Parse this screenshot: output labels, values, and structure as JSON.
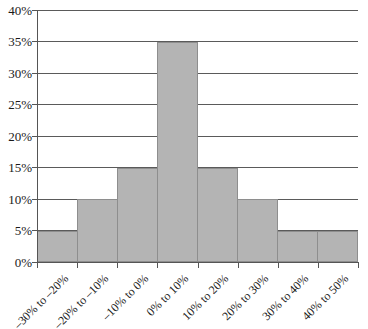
{
  "chart_data": {
    "type": "bar",
    "title": "",
    "subtitle": "",
    "xlabel": "",
    "ylabel": "",
    "categories": [
      "–30% to –20%",
      "–20% to –10%",
      "–10% to 0%",
      "0% to 10%",
      "10% to 20%",
      "20% to 30%",
      "30% to 40%",
      "40% to 50%"
    ],
    "values": [
      5,
      10,
      15,
      35,
      15,
      10,
      5,
      5
    ],
    "value_labels": [
      "5%",
      "10%",
      "15%",
      "35%",
      "15%",
      "10%",
      "5%",
      "5%"
    ],
    "ylim": [
      0,
      40
    ],
    "ytick_values": [
      0,
      5,
      10,
      15,
      20,
      25,
      30,
      35,
      40
    ],
    "ytick_labels": [
      "0%",
      "5%",
      "10%",
      "15%",
      "20%",
      "25%",
      "30%",
      "35%",
      "40%"
    ],
    "grid": true,
    "grid_axis": "y",
    "legend": "none",
    "bar_gap": "none",
    "series": [
      {
        "name": "Frequency",
        "values": [
          5,
          10,
          15,
          35,
          15,
          10,
          5,
          5
        ]
      }
    ],
    "colors": {
      "bar_fill": "#b4b4b4",
      "bar_stroke": "#8e8e8e",
      "gridline": "#5a5a5a",
      "axis": "#555555",
      "text": "#1a1a1a",
      "background": "#ffffff"
    },
    "annotations": []
  }
}
